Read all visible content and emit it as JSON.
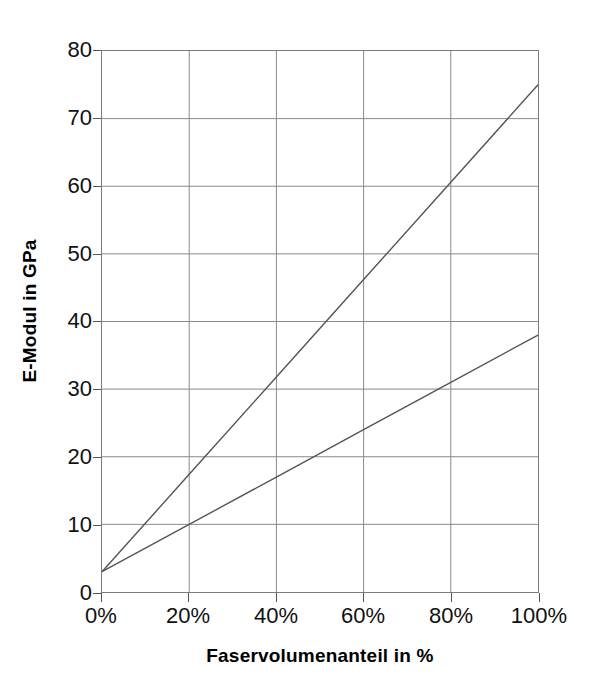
{
  "chart_data": {
    "type": "line",
    "title": "",
    "xlabel": "Faservolumenanteil in %",
    "ylabel": "E-Modul in GPa",
    "xlim": [
      0,
      100
    ],
    "ylim": [
      0,
      80
    ],
    "grid": true,
    "legend": "none",
    "x_tick_labels": [
      "0%",
      "20%",
      "40%",
      "60%",
      "80%",
      "100%"
    ],
    "x_tick_values": [
      0,
      20,
      40,
      60,
      80,
      100
    ],
    "y_tick_labels": [
      "0",
      "10",
      "20",
      "30",
      "40",
      "50",
      "60",
      "70",
      "80"
    ],
    "y_tick_values": [
      0,
      10,
      20,
      30,
      40,
      50,
      60,
      70,
      80
    ],
    "x": [
      0,
      20,
      40,
      60,
      80,
      100
    ],
    "series": [
      {
        "name": "obere Kennlinie",
        "color": "#555555",
        "values": [
          3,
          17.4,
          31.8,
          46.2,
          60.6,
          75
        ]
      },
      {
        "name": "untere Kennlinie",
        "color": "#555555",
        "values": [
          3,
          10,
          17,
          24,
          31,
          38
        ]
      }
    ]
  },
  "colors": {
    "grid": "#8a8a8a",
    "frame": "#7a7a7a",
    "series": "#555555",
    "text": "#111111",
    "background": "#ffffff"
  }
}
